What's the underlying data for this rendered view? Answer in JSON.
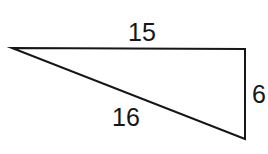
{
  "figure": {
    "type": "right-triangle-diagram",
    "background_color": "#ffffff",
    "stroke_color": "#161616",
    "stroke_width": 2,
    "label_color": "#161616",
    "vertices": {
      "apex_left": {
        "x": 12,
        "y": 48
      },
      "corner_top_right": {
        "x": 245,
        "y": 49
      },
      "corner_bottom_right": {
        "x": 245,
        "y": 139
      }
    },
    "sides": [
      {
        "name": "top",
        "label": "15",
        "from": "apex_left",
        "to": "corner_top_right"
      },
      {
        "name": "hypotenuse",
        "label": "16",
        "from": "apex_left",
        "to": "corner_bottom_right"
      },
      {
        "name": "right-vertical",
        "label": "6",
        "from": "corner_top_right",
        "to": "corner_bottom_right"
      }
    ]
  },
  "labels": {
    "top_side": "15",
    "hypotenuse": "16",
    "right_side": "6"
  }
}
